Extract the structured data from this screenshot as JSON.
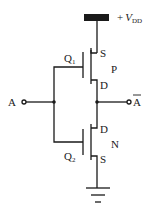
{
  "diagram": {
    "type": "CMOS inverter circuit",
    "supply": {
      "label_prefix": "+",
      "label_main": "V",
      "label_sub": "DD"
    },
    "input": {
      "label": "A"
    },
    "output": {
      "label": "A",
      "overbar": true
    },
    "transistors": [
      {
        "name": "Q",
        "index": "1",
        "type_label": "P",
        "source_label": "S",
        "drain_label": "D"
      },
      {
        "name": "Q",
        "index": "2",
        "type_label": "N",
        "source_label": "S",
        "drain_label": "D"
      }
    ],
    "ground": {
      "symbol": "ground-icon"
    },
    "colors": {
      "line": "#1a1a1a",
      "background": "#ffffff"
    }
  }
}
